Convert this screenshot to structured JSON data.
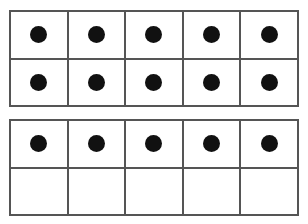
{
  "page": {
    "background_color": "#ffffff"
  },
  "style": {
    "border_color": "#555555",
    "dot_color": "#111111",
    "cell_background": "#ffffff"
  },
  "chart_data": {
    "type": "table",
    "xlabel": "",
    "ylabel": "",
    "total_counters": 15,
    "frames": [
      {
        "name": "frame-1",
        "columns": 5,
        "rows": 2,
        "filled_count": 10,
        "cells": [
          [
            true,
            true,
            true,
            true,
            true
          ],
          [
            true,
            true,
            true,
            true,
            true
          ]
        ]
      },
      {
        "name": "frame-2",
        "columns": 5,
        "rows": 2,
        "filled_count": 5,
        "cells": [
          [
            true,
            true,
            true,
            true,
            true
          ],
          [
            false,
            false,
            false,
            false,
            false
          ]
        ]
      }
    ]
  }
}
